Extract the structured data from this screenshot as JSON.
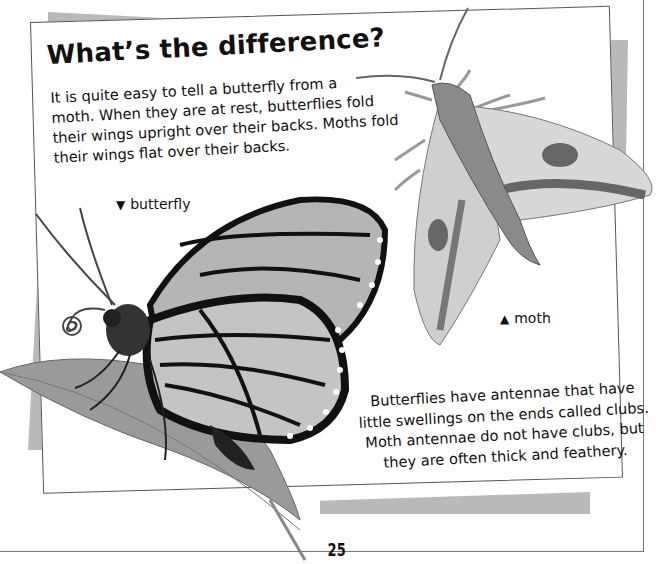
{
  "page": {
    "title": "What’s the difference?",
    "intro_lines": [
      "It is quite easy to tell a butterfly from a",
      "moth. When they are at rest, butterflies fold",
      "their wings upright over their backs. Moths fold",
      "their wings flat over their backs."
    ],
    "labels": {
      "butterfly": {
        "icon": "triangle-down-icon",
        "glyph": "▼",
        "text": "butterfly"
      },
      "moth": {
        "icon": "triangle-up-icon",
        "glyph": "▲",
        "text": "moth"
      }
    },
    "bottom_lines": [
      "Butterflies have antennae that have",
      "little swellings on the ends called clubs.",
      "Moth antennae do not have clubs, but",
      "they are often thick and feathery."
    ],
    "page_number": "25"
  },
  "illustrations": {
    "butterfly": "monarch-butterfly-illustration",
    "moth": "hawk-moth-illustration",
    "leaf": "leaf-illustration"
  },
  "colors": {
    "background": "#ffffff",
    "grey_panel": "#b9b9b9",
    "border": "#555555",
    "text": "#111111"
  }
}
